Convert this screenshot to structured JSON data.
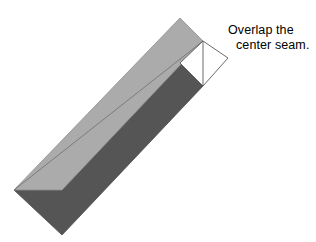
{
  "figure": {
    "title": "Overlap the center seam",
    "background_color": "#ffffff",
    "annotation": {
      "line1": "Overlap the",
      "line2": "center seam.",
      "text_color": "#000000"
    },
    "colors": {
      "light_band": "#ababab",
      "dark_band": "#555555",
      "white_panel": "#ffffff",
      "outline": "#555555",
      "seam_line": "#555555"
    },
    "shapes": {
      "light_band": {
        "name": "light-gray-folded-strip",
        "fill": "#ababab",
        "points": "180,18 203,41 62,190 14,190"
      },
      "dark_band": {
        "name": "dark-gray-folded-strip",
        "fill": "#555555",
        "points": "203,41 203,86 62,235 14,190"
      },
      "white_panel": {
        "name": "white-overlap-panel",
        "fill": "#ffffff",
        "points": "203,41 228,58 203,86 180,63"
      },
      "outline_diamond": {
        "name": "overlap-outline",
        "points": "203,41 228,58 203,86"
      },
      "seam_line": {
        "name": "center-seam-line",
        "x1": 203,
        "y1": 41,
        "x2": 203,
        "y2": 86
      },
      "leader_line": {
        "name": "annotation-leader-line",
        "x1": 228,
        "y1": 58,
        "x2": 203,
        "y2": 41
      }
    }
  }
}
